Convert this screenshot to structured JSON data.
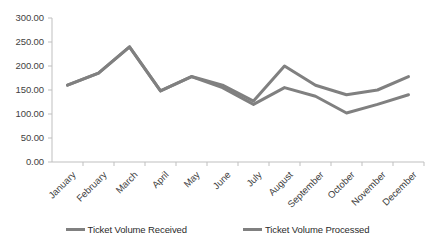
{
  "chart_data": {
    "type": "line",
    "title": "",
    "xlabel": "",
    "ylabel": "",
    "ylim": [
      0,
      300
    ],
    "ytick_step": 50,
    "ytick_labels": [
      "300.00",
      "250.00",
      "200.00",
      "150.00",
      "100.00",
      "50.00",
      "0.00"
    ],
    "ytick_values": [
      300,
      250,
      200,
      150,
      100,
      50,
      0
    ],
    "grid": false,
    "legend_position": "bottom",
    "line_color": "#808080",
    "categories": [
      "January",
      "February",
      "March",
      "April",
      "May",
      "June",
      "July",
      "August",
      "September",
      "October",
      "November",
      "December"
    ],
    "series": [
      {
        "name": "Ticket Volume Received",
        "color": "#808080",
        "values": [
          160,
          185,
          240,
          148,
          178,
          160,
          127,
          200,
          160,
          140,
          150,
          178
        ]
      },
      {
        "name": "Ticket Volume Processed",
        "color": "#808080",
        "values": [
          160,
          185,
          240,
          148,
          178,
          155,
          120,
          155,
          137,
          102,
          120,
          140
        ]
      }
    ]
  },
  "legend": {
    "items": [
      {
        "label": "Ticket Volume Received"
      },
      {
        "label": "Ticket Volume Processed"
      }
    ]
  }
}
